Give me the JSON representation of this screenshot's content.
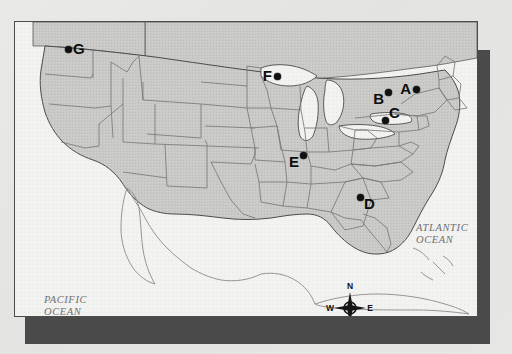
{
  "figure": {
    "kind": "reference-map",
    "style": "photocopied grayscale map with drop shadow"
  },
  "map": {
    "land_fill": "#c9c9c7",
    "water_fill": "#f2f2f0",
    "border_color": "#4c4c4c",
    "shadow_color": "#4a4a4a",
    "page_background": "#e8e8e6"
  },
  "labels": {
    "pacific_ocean": "PACIFIC\nOCEAN",
    "atlantic_ocean": "ATLANTIC\nOCEAN"
  },
  "compass": {
    "name": "compass-rose",
    "north": "N",
    "south": "S",
    "east": "E",
    "west": "W"
  },
  "markers": [
    {
      "id": "A",
      "label": "A",
      "x": 416,
      "y": 89,
      "label_position": "left"
    },
    {
      "id": "B",
      "label": "B",
      "x": 388,
      "y": 92,
      "label_position": "bottom-left"
    },
    {
      "id": "C",
      "label": "C",
      "x": 385,
      "y": 120,
      "label_position": "top-right"
    },
    {
      "id": "D",
      "label": "D",
      "x": 360,
      "y": 197,
      "label_position": "bottom-right"
    },
    {
      "id": "E",
      "label": "E",
      "x": 303,
      "y": 155,
      "label_position": "bottom-left"
    },
    {
      "id": "F",
      "label": "F",
      "x": 277,
      "y": 76,
      "label_position": "left"
    },
    {
      "id": "G",
      "label": "G",
      "x": 68,
      "y": 49,
      "label_position": "right"
    }
  ]
}
